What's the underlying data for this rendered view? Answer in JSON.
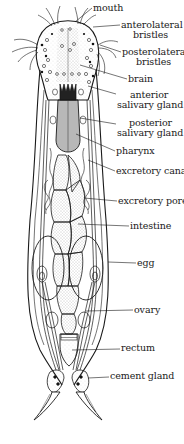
{
  "diagram": {
    "colors": {
      "ink": "#1a1a1a",
      "paper": "#ffffff",
      "stipple": "#8a8a8a"
    },
    "labels": [
      {
        "id": "mouth",
        "lines": [
          "mouth"
        ],
        "x": 93,
        "y": 3,
        "leader": [
          [
            92,
            8
          ],
          [
            75,
            22
          ]
        ]
      },
      {
        "id": "anterolateral-bristles",
        "lines": [
          "anterolateral",
          "bristles"
        ],
        "x": 121,
        "y": 20,
        "leader": [
          [
            120,
            25
          ],
          [
            93,
            27
          ]
        ]
      },
      {
        "id": "posterolateral-bristles",
        "lines": [
          "posterolateral",
          "bristles"
        ],
        "x": 122,
        "y": 47,
        "leader": [
          [
            121,
            52
          ],
          [
            100,
            45
          ]
        ]
      },
      {
        "id": "brain",
        "lines": [
          "brain"
        ],
        "x": 128,
        "y": 74,
        "leader": [
          [
            127,
            79
          ],
          [
            80,
            65
          ]
        ]
      },
      {
        "id": "anterior-salivary-gland",
        "lines": [
          "anterior",
          "salivary gland"
        ],
        "x": 117,
        "y": 90,
        "leader": [
          [
            116,
            94
          ],
          [
            88,
            86
          ]
        ]
      },
      {
        "id": "posterior-salivary-gland",
        "lines": [
          "posterior",
          "salivary gland"
        ],
        "x": 117,
        "y": 118,
        "leader": [
          [
            116,
            124
          ],
          [
            80,
            118
          ]
        ]
      },
      {
        "id": "pharynx",
        "lines": [
          "pharynx"
        ],
        "x": 116,
        "y": 146,
        "leader": [
          [
            115,
            151
          ],
          [
            76,
            134
          ]
        ]
      },
      {
        "id": "excretory-canal",
        "lines": [
          "excretory canal"
        ],
        "x": 116,
        "y": 166,
        "leader": [
          [
            115,
            171
          ],
          [
            88,
            160
          ]
        ]
      },
      {
        "id": "excretory-pore",
        "lines": [
          "excretory pore"
        ],
        "x": 118,
        "y": 196,
        "leader": [
          [
            117,
            201
          ],
          [
            84,
            198
          ]
        ]
      },
      {
        "id": "intestine",
        "lines": [
          "intestine"
        ],
        "x": 130,
        "y": 221,
        "leader": [
          [
            129,
            226
          ],
          [
            78,
            224
          ]
        ]
      },
      {
        "id": "egg",
        "lines": [
          "egg"
        ],
        "x": 137,
        "y": 258,
        "leader": [
          [
            136,
            263
          ],
          [
            108,
            262
          ]
        ]
      },
      {
        "id": "ovary",
        "lines": [
          "ovary"
        ],
        "x": 134,
        "y": 305,
        "leader": [
          [
            133,
            310
          ],
          [
            86,
            311
          ]
        ]
      },
      {
        "id": "rectum",
        "lines": [
          "rectum"
        ],
        "x": 121,
        "y": 343,
        "leader": [
          [
            120,
            349
          ],
          [
            72,
            350
          ]
        ]
      },
      {
        "id": "cement-gland",
        "lines": [
          "cement gland"
        ],
        "x": 110,
        "y": 371,
        "leader": [
          [
            109,
            377
          ],
          [
            88,
            378
          ]
        ]
      }
    ]
  }
}
